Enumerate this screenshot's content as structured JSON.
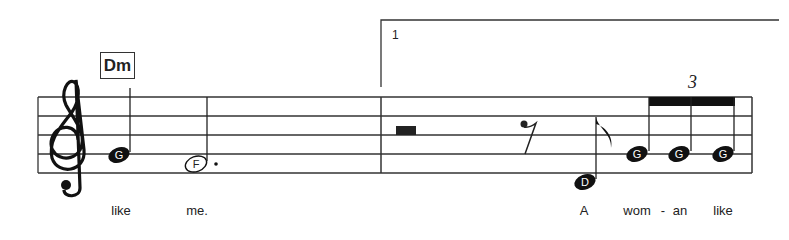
{
  "score": {
    "chord_symbol": "Dm",
    "ending_number": "1",
    "tuplet_number": "3",
    "clef": "treble",
    "notes": [
      {
        "label": "G",
        "duration": "half",
        "filled": true
      },
      {
        "label": "F",
        "duration": "dotted-half",
        "filled": false
      },
      {
        "label": "rest",
        "duration": "half-rest"
      },
      {
        "label": "rest",
        "duration": "eighth-rest"
      },
      {
        "label": "D",
        "duration": "eighth",
        "filled": true
      },
      {
        "label": "G",
        "duration": "eighth-triplet",
        "filled": true
      },
      {
        "label": "G",
        "duration": "eighth-triplet",
        "filled": true
      },
      {
        "label": "G",
        "duration": "eighth-triplet",
        "filled": true
      }
    ],
    "lyrics": [
      "like",
      "me.",
      "A",
      "wom",
      "-",
      "an",
      "like"
    ]
  }
}
